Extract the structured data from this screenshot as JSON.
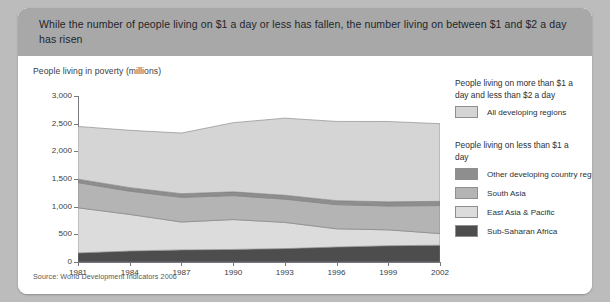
{
  "header": {
    "title": "While the number of people living on $1 a day or less has fallen, the number living on between $1 and $2 a day has risen"
  },
  "source": "Source: World Development Indicators 2006",
  "legend": {
    "group1_title": "People living on more than $1 a day and less than $2 a day",
    "group2_title": "People living on less than $1 a day",
    "items": [
      {
        "label": "All developing regions",
        "color": "#d5d5d5"
      },
      {
        "label": "Other developing country regions",
        "color": "#8e8e8e"
      },
      {
        "label": "South Asia",
        "color": "#b4b4b4"
      },
      {
        "label": "East Asia & Pacific",
        "color": "#dcdcdc"
      },
      {
        "label": "Sub-Saharan Africa",
        "color": "#4d4d4d"
      }
    ]
  },
  "chart_data": {
    "type": "area",
    "title": "People living in poverty (millions)",
    "xlabel": "",
    "ylabel": "People living in poverty (millions)",
    "stacked": true,
    "grid": false,
    "legend_position": "right",
    "ylim": [
      0,
      3000
    ],
    "yticks": [
      0,
      500,
      1000,
      1500,
      2000,
      2500,
      3000
    ],
    "ytick_labels": [
      "0",
      "500",
      "1,000",
      "1,500",
      "2,000",
      "2,500",
      "3,000"
    ],
    "xlim": [
      1981,
      2002
    ],
    "xticks": [
      1981,
      1984,
      1987,
      1990,
      1993,
      1996,
      1999,
      2002
    ],
    "xtick_labels": [
      "1981",
      "1984",
      "1987",
      "1990",
      "1993",
      "1996",
      "1999",
      "2002"
    ],
    "x": [
      1981,
      1984,
      1987,
      1990,
      1993,
      1996,
      1999,
      2002
    ],
    "series": [
      {
        "name": "Sub-Saharan Africa",
        "color": "#4d4d4d",
        "values": [
          164,
          198,
          219,
          227,
          242,
          271,
          294,
          303
        ]
      },
      {
        "name": "East Asia & Pacific",
        "color": "#dcdcdc",
        "values": [
          816,
          662,
          504,
          540,
          474,
          329,
          287,
          211
        ]
      },
      {
        "name": "South Asia",
        "color": "#b4b4b4",
        "values": [
          455,
          420,
          446,
          433,
          420,
          437,
          432,
          506
        ]
      },
      {
        "name": "Other developing country regions",
        "color": "#8e8e8e",
        "values": [
          62,
          64,
          66,
          68,
          70,
          72,
          74,
          76
        ]
      },
      {
        "name": "All developing regions",
        "color": "#d5d5d5",
        "values": [
          953,
          1036,
          1095,
          1250,
          1394,
          1431,
          1452,
          1404
        ]
      }
    ],
    "series_totals": [
      2450,
      2380,
      2330,
      2518,
      2600,
      2540,
      2539,
      2500
    ]
  }
}
